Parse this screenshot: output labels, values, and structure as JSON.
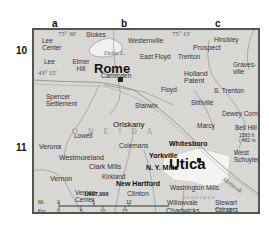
{
  "grid": {
    "columns": [
      "a",
      "b",
      "c"
    ],
    "rows": [
      "10",
      "11"
    ]
  },
  "coordinates": {
    "lon_75_30": "75° 30'",
    "lon_75_15_top": "75° 15'",
    "lon_75_15_bottom": "75° 15'",
    "lat_43_15": "43° 15'"
  },
  "cities": {
    "rome": "Rome",
    "utica": "Utica"
  },
  "towns_bold": {
    "whitesboro": "Whitesboro",
    "yorkville": "Yorkville",
    "ny_mills": "N. Y. Mills",
    "new_hartford": "New Hartford"
  },
  "places": {
    "lee_center": "Lee Center",
    "stokes": "Stokes",
    "westernville": "Westernville",
    "hinckley": "Hinckley",
    "prospect": "Prospect",
    "lee": "Lee",
    "elmer_hill": "Elmer Hill",
    "east_floyd": "East Floyd",
    "trenton": "Trenton",
    "gravesville": "Graves-ville",
    "camroden": "Camroden",
    "holland_patent": "Holland Patent",
    "floyd": "Floyd",
    "s_trenton": "S. Trenton",
    "stittville": "Stittville",
    "spencer_settlement": "Spencer Settlement",
    "stanwix": "Stanwix",
    "oriskany": "Oriskany",
    "dewey_corners": "Dewey Corners",
    "marcy": "Marcy",
    "bell_hill": "Bell Hill",
    "bell_hill_elev": "1583 ft / 482 m",
    "verona": "Verona",
    "lowell": "Lowell",
    "colemans": "Colemans",
    "westmoreland": "Westmoreland",
    "clark_mills": "Clark Mills",
    "west_schuyler": "West Schuyler",
    "vernon": "Vernon",
    "kirkland": "Kirkland",
    "vernon_center": "Vernon Center",
    "clinton": "Clinton",
    "washington_mills": "Washington Mills",
    "willowvale": "Willowvale",
    "chadwicks": "Chadwicks",
    "stewart_corners": "Stewart Corners"
  },
  "water": {
    "delta_lake": "Delta L.",
    "mohawk": "Mohawk"
  },
  "regions": {
    "oneida": "O N E I D A",
    "herkimer": "HERKIMER"
  },
  "scale": {
    "ratio": "1/697,000",
    "mi_label": "Mi.",
    "km_label": "Km.",
    "mi_ticks": [
      "0",
      "5",
      "10"
    ],
    "km_ticks": [
      "0",
      "5",
      "10",
      "15"
    ]
  },
  "colors": {
    "land": "#d7d7d4",
    "urban": "#f4f4f2",
    "roads": "#8a8a8a",
    "water": "#f0f0f0",
    "frame": "#555555"
  }
}
